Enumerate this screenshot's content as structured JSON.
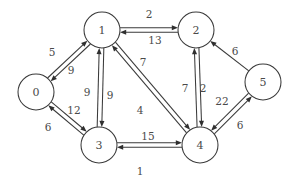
{
  "figure": {
    "background_color": "#ffffff",
    "stroke_color": "#3a3a3a",
    "text_color": "#4a4a4a",
    "width": 296,
    "height": 183
  },
  "chart_data": {
    "type": "diagram",
    "diagram_kind": "directed-weighted-graph",
    "title": "",
    "directed": true,
    "weighted": true,
    "node_count": 6,
    "edge_count": 17,
    "nodes": [
      {
        "id": "0",
        "label": "0",
        "cx": 36,
        "cy": 92,
        "r": 18
      },
      {
        "id": "1",
        "label": "1",
        "cx": 102,
        "cy": 30,
        "r": 18
      },
      {
        "id": "2",
        "label": "2",
        "cx": 196,
        "cy": 30,
        "r": 18
      },
      {
        "id": "3",
        "label": "3",
        "cx": 99,
        "cy": 145,
        "r": 18
      },
      {
        "id": "4",
        "label": "4",
        "cx": 200,
        "cy": 145,
        "r": 18
      },
      {
        "id": "5",
        "label": "5",
        "cx": 263,
        "cy": 82,
        "r": 18
      }
    ],
    "edges": [
      {
        "from": "0",
        "to": "1",
        "weight": 5,
        "label": "5",
        "lx": 52,
        "ly": 52
      },
      {
        "from": "1",
        "to": "0",
        "weight": 9,
        "label": "9",
        "lx": 71,
        "ly": 70
      },
      {
        "from": "0",
        "to": "3",
        "weight": 12,
        "label": "12",
        "lx": 74,
        "ly": 110
      },
      {
        "from": "3",
        "to": "0",
        "weight": 6,
        "label": "6",
        "lx": 48,
        "ly": 127
      },
      {
        "from": "1",
        "to": "2",
        "weight": 2,
        "label": "2",
        "lx": 149,
        "ly": 14
      },
      {
        "from": "2",
        "to": "1",
        "weight": 13,
        "label": "13",
        "lx": 155,
        "ly": 40
      },
      {
        "from": "1",
        "to": "3",
        "weight": 9,
        "label": "9",
        "lx": 87,
        "ly": 92
      },
      {
        "from": "3",
        "to": "1",
        "weight": 9,
        "label": "9",
        "lx": 110,
        "ly": 95
      },
      {
        "from": "1",
        "to": "4",
        "weight": 4,
        "label": "4",
        "lx": 140,
        "ly": 110
      },
      {
        "from": "4",
        "to": "1",
        "weight": 7,
        "label": "7",
        "lx": 143,
        "ly": 62
      },
      {
        "from": "2",
        "to": "4",
        "weight": 2,
        "label": "2",
        "lx": 203,
        "ly": 88
      },
      {
        "from": "4",
        "to": "2",
        "weight": 7,
        "label": "7",
        "lx": 185,
        "ly": 88
      },
      {
        "from": "3",
        "to": "4",
        "weight": 1,
        "label": "1",
        "lx": 140,
        "ly": 171
      },
      {
        "from": "4",
        "to": "3",
        "weight": 15,
        "label": "15",
        "lx": 148,
        "ly": 136
      },
      {
        "from": "5",
        "to": "2",
        "weight": 6,
        "label": "6",
        "lx": 235,
        "ly": 51
      },
      {
        "from": "5",
        "to": "4",
        "weight": 22,
        "label": "22",
        "lx": 222,
        "ly": 101
      },
      {
        "from": "4",
        "to": "5",
        "weight": 6,
        "label": "6",
        "lx": 240,
        "ly": 125
      }
    ],
    "adjacency_list": {
      "0": [
        {
          "to": "1",
          "w": 5
        },
        {
          "to": "3",
          "w": 12
        }
      ],
      "1": [
        {
          "to": "0",
          "w": 9
        },
        {
          "to": "2",
          "w": 2
        },
        {
          "to": "3",
          "w": 9
        },
        {
          "to": "4",
          "w": 4
        }
      ],
      "2": [
        {
          "to": "1",
          "w": 13
        },
        {
          "to": "4",
          "w": 2
        }
      ],
      "3": [
        {
          "to": "0",
          "w": 6
        },
        {
          "to": "1",
          "w": 9
        },
        {
          "to": "4",
          "w": 1
        }
      ],
      "4": [
        {
          "to": "1",
          "w": 7
        },
        {
          "to": "2",
          "w": 7
        },
        {
          "to": "3",
          "w": 15
        },
        {
          "to": "5",
          "w": 6
        }
      ],
      "5": [
        {
          "to": "2",
          "w": 6
        },
        {
          "to": "4",
          "w": 22
        }
      ]
    }
  }
}
